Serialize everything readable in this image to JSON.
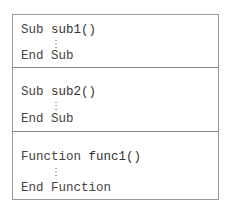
{
  "blocks": [
    {
      "keyword": "Sub",
      "name": "sub1()",
      "ellipsis": "⋮",
      "end": "End Sub"
    },
    {
      "keyword": "Sub",
      "name": "sub2()",
      "ellipsis": "⋮",
      "end": "End Sub"
    },
    {
      "keyword": "Function",
      "name": "func1()",
      "ellipsis": "⋮",
      "end": "End Function"
    }
  ]
}
